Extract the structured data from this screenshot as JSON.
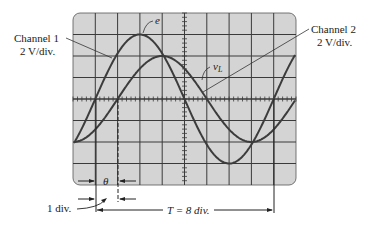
{
  "figure": {
    "channel1": {
      "name": "Channel 1",
      "scale": "2 V/div.",
      "signal_label": "e"
    },
    "channel2": {
      "name": "Channel 2",
      "scale": "2 V/div.",
      "signal_label": "v",
      "signal_subscript": "L"
    },
    "phase_label": "θ",
    "one_div_label": "1 div.",
    "period_label": "T = 8 div."
  },
  "colors": {
    "screen": "#d4d4d4",
    "grid": "#3a3a3a",
    "trace": "#3c3c3c",
    "text": "#222222"
  },
  "chart_data": {
    "type": "line",
    "grid": {
      "horizontal_divisions": 10,
      "vertical_divisions": 8
    },
    "series": [
      {
        "name": "e (Channel 1)",
        "amplitude_div": 3,
        "period_div": 8,
        "zero_crossing_rising_div": 1
      },
      {
        "name": "v_L (Channel 2)",
        "amplitude_div": 2,
        "period_div": 8,
        "zero_crossing_rising_div": 2
      }
    ],
    "annotations": [
      "Channel 1 2 V/div.",
      "Channel 2 2 V/div.",
      "θ",
      "1 div.",
      "T = 8 div."
    ]
  }
}
